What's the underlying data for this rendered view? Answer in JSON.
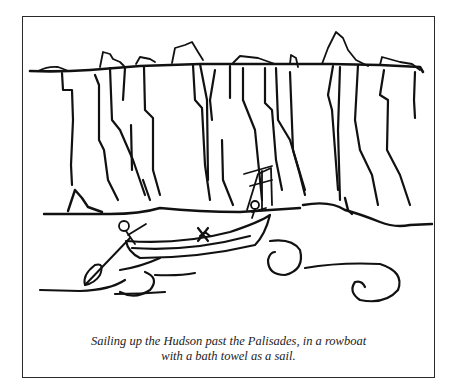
{
  "figure": {
    "caption_line1": "Sailing up the Hudson past the Palisades, in a rowboat",
    "caption_line2": "with a bath towel as a sail.",
    "ink_color": "#111111",
    "border_color": "#2a2a2a"
  }
}
